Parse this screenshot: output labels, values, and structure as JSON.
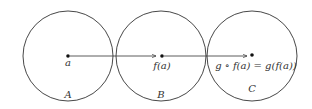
{
  "diagram": {
    "type": "function-composition",
    "sets": [
      {
        "name": "A",
        "cx": 68,
        "cy": 56,
        "r": 45,
        "label_x": 68,
        "label_y": 98
      },
      {
        "name": "B",
        "cx": 161,
        "cy": 56,
        "r": 45,
        "label_x": 161,
        "label_y": 98
      },
      {
        "name": "C",
        "cx": 252,
        "cy": 56,
        "r": 45,
        "label_x": 252,
        "label_y": 92
      }
    ],
    "points": [
      {
        "label": "a",
        "x": 68,
        "y": 56,
        "label_x": 68,
        "label_y": 66
      },
      {
        "label": "f(a)",
        "x": 162,
        "y": 56,
        "label_x": 162,
        "label_y": 69
      },
      {
        "label": "g ∘ f(a) = g(f(a))",
        "x": 252,
        "y": 55,
        "label_x": 256,
        "label_y": 69
      }
    ],
    "arrows": [
      {
        "from": "a",
        "to": "f(a)",
        "x1": 70,
        "y1": 56,
        "x2": 156,
        "y2": 56
      },
      {
        "from": "f(a)",
        "to": "g ∘ f(a)",
        "x1": 164,
        "y1": 56,
        "x2": 247,
        "y2": 56
      }
    ],
    "colors": {
      "stroke": "#333333",
      "background": "#ffffff"
    }
  }
}
